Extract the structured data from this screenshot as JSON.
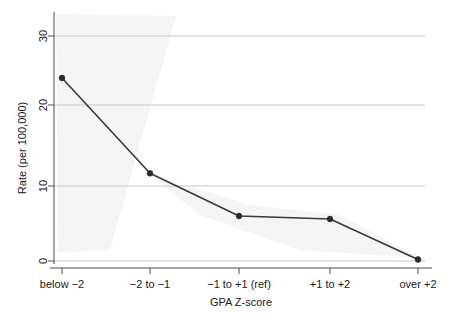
{
  "chart_data": {
    "type": "line",
    "title": "",
    "subtitle": "",
    "xlabel": "GPA Z-score",
    "ylabel": "Rate (per 100,000)",
    "categories": [
      "below −2",
      "−2 to −1",
      "−1 to +1 (ref)",
      "+1 to +2",
      "over +2"
    ],
    "values": [
      24.4,
      11.7,
      6.0,
      5.6,
      0.2
    ],
    "series": [
      {
        "name": "Rate (per 100,000)",
        "values": [
          24.4,
          11.7,
          6.0,
          5.6,
          0.2
        ]
      }
    ],
    "ylim": [
      0,
      32
    ],
    "yticks": [
      0,
      10,
      20,
      30
    ],
    "ytick_labels": [
      "0",
      "10",
      "20",
      "30"
    ],
    "grid": "horizontal",
    "legend": "none",
    "marker": "filled-circle",
    "line_color": "#3a3a3a",
    "marker_color": "#2b2b2b",
    "grid_color": "#c9c9c9",
    "axis_color": "#4d4d4d",
    "background": "#ffffff"
  },
  "axes": {
    "y_title": "Rate (per 100,000)",
    "x_title": "GPA Z-score",
    "y_tick_0": "0",
    "y_tick_10": "10",
    "y_tick_20": "20",
    "y_tick_30": "30",
    "x_tick_1": "below −2",
    "x_tick_2": "−2 to −1",
    "x_tick_3": "−1 to +1 (ref)",
    "x_tick_4": "+1 to +2",
    "x_tick_5": "over +2"
  }
}
